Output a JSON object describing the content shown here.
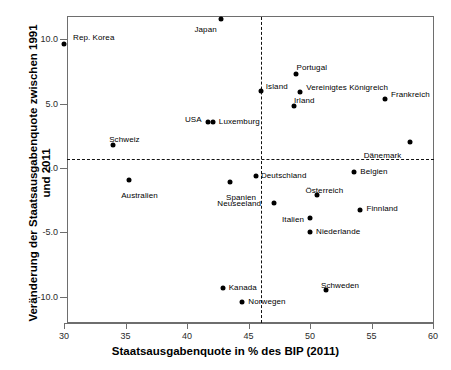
{
  "chart_data": {
    "type": "scatter",
    "title": "",
    "xlabel": "Staatsausgabenquote in % des BIP (2011)",
    "ylabel": "Veränderung der Staatsausgabenquote zwischen 1991 und 2011",
    "xlim": [
      30,
      60
    ],
    "ylim": [
      -12.0,
      12.2
    ],
    "xticks": [
      30,
      35,
      40,
      45,
      50,
      55,
      60
    ],
    "xticklabels": [
      "30",
      "35",
      "40",
      "45",
      "50",
      "55",
      "60"
    ],
    "yticks": [
      10.0,
      5.0,
      0.0,
      -5.0,
      -10.0
    ],
    "yticklabels": [
      "10.0",
      "5.0",
      "0.0",
      "-5.0",
      "-10.0"
    ],
    "grid": false,
    "legend": "none",
    "reference_lines": [
      {
        "orientation": "horizontal",
        "value": 0.7,
        "style": "dashed"
      },
      {
        "orientation": "vertical",
        "value": 46.0,
        "style": "dashed"
      }
    ],
    "marker_color": "#000000",
    "points": [
      {
        "label": "Rep. Korea",
        "x": 30.0,
        "y": 9.6,
        "lx": 9,
        "ly": -11
      },
      {
        "label": "Japan",
        "x": 42.8,
        "y": 11.6,
        "lx": -27,
        "ly": 6
      },
      {
        "label": "Portugal",
        "x": 48.9,
        "y": 7.3,
        "lx": 0,
        "ly": -11
      },
      {
        "label": "Island",
        "x": 46.0,
        "y": 6.0,
        "lx": 5,
        "ly": -9
      },
      {
        "label": "Vereinigtes Königreich",
        "x": 49.2,
        "y": 5.9,
        "lx": 6,
        "ly": -9
      },
      {
        "label": "Frankreich",
        "x": 56.1,
        "y": 5.4,
        "lx": 6,
        "ly": -9
      },
      {
        "label": "Irland",
        "x": 48.7,
        "y": 4.8,
        "lx": 0,
        "ly": -10
      },
      {
        "label": "USA",
        "x": 41.7,
        "y": 3.6,
        "lx": -23,
        "ly": -7
      },
      {
        "label": "Luxemburg",
        "x": 42.1,
        "y": 3.6,
        "lx": 6,
        "ly": -5
      },
      {
        "label": "Dänemark",
        "x": 58.1,
        "y": 2.0,
        "lx": -46,
        "ly": 9
      },
      {
        "label": "Schweiz",
        "x": 34.0,
        "y": 1.8,
        "lx": -4,
        "ly": -10
      },
      {
        "label": "Belgien",
        "x": 53.6,
        "y": -0.3,
        "lx": 6,
        "ly": -5
      },
      {
        "label": "Australien",
        "x": 35.3,
        "y": -0.9,
        "lx": -8,
        "ly": 11
      },
      {
        "label": "Deutschland",
        "x": 45.6,
        "y": -0.6,
        "lx": 5,
        "ly": -5
      },
      {
        "label": "Spanien",
        "x": 43.5,
        "y": -1.1,
        "lx": -4,
        "ly": 11
      },
      {
        "label": "Österreich",
        "x": 50.6,
        "y": -2.1,
        "lx": -12,
        "ly": -9
      },
      {
        "label": "Neuseeland",
        "x": 47.1,
        "y": -2.7,
        "lx": -57,
        "ly": -4
      },
      {
        "label": "Italien",
        "x": 50.0,
        "y": -3.9,
        "lx": -28,
        "ly": -3
      },
      {
        "label": "Finnland",
        "x": 54.1,
        "y": -3.3,
        "lx": 6,
        "ly": -6
      },
      {
        "label": "Niederlande",
        "x": 50.0,
        "y": -5.0,
        "lx": 6,
        "ly": -5
      },
      {
        "label": "Kanada",
        "x": 42.9,
        "y": -9.3,
        "lx": 6,
        "ly": -5
      },
      {
        "label": "Norwegen",
        "x": 44.5,
        "y": -10.4,
        "lx": 6,
        "ly": -5
      },
      {
        "label": "Schweden",
        "x": 51.3,
        "y": -9.5,
        "lx": -5,
        "ly": -9
      }
    ]
  }
}
